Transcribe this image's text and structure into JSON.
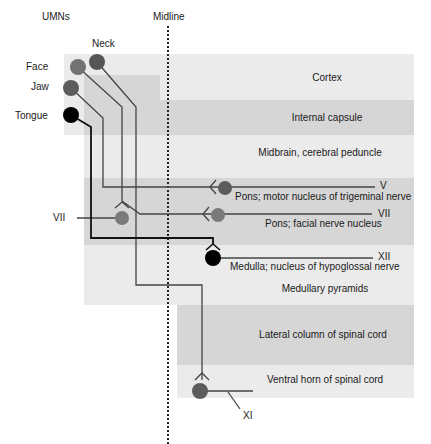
{
  "headers": {
    "umns": "UMNs",
    "midline": "Midline"
  },
  "umn_labels": {
    "neck": "Neck",
    "face": "Face",
    "jaw": "Jaw",
    "tongue": "Tongue"
  },
  "levels": [
    {
      "id": "cortex",
      "label": "Cortex",
      "shade": "light"
    },
    {
      "id": "internal-capsule",
      "label": "Internal capsule",
      "shade": "dark"
    },
    {
      "id": "midbrain",
      "label": "Midbrain, cerebral peduncle",
      "shade": "light"
    },
    {
      "id": "pons-v",
      "label": "Pons; motor nucleus of trigeminal nerve",
      "shade": "dark"
    },
    {
      "id": "pons-vii",
      "label": "Pons; facial nerve nucleus",
      "shade": "dark"
    },
    {
      "id": "medulla-xii",
      "label": "Medulla; nucleus of hypoglossal nerve",
      "shade": "light"
    },
    {
      "id": "medullary-pyramids",
      "label": "Medullary pyramids",
      "shade": "light"
    },
    {
      "id": "lateral-column",
      "label": "Lateral column of spinal cord",
      "shade": "dark"
    },
    {
      "id": "ventral-horn",
      "label": "Ventral horn of spinal cord",
      "shade": "light"
    }
  ],
  "nerve_labels": {
    "v": "V",
    "vii_right": "VII",
    "vii_left": "VII",
    "xii": "XII",
    "xi": "XI"
  },
  "colors": {
    "light_band": "#ebebeb",
    "dark_band": "#d6d6d6",
    "neuron_gray": "#5c5c5c",
    "neuron_face": "#727272",
    "neuron_black": "#000000",
    "line": "#333333"
  }
}
